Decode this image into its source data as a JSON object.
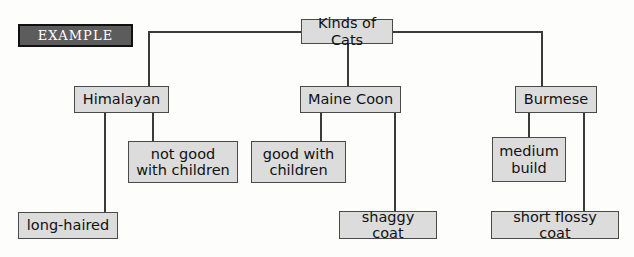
{
  "page": {
    "background": "#fdfdfc",
    "box_fill": "#dcdcdc",
    "box_border": "#4a4a4a",
    "line_color": "#3a3a3a",
    "example_fill": "#5c5c5c",
    "example_text_color": "#ffffff"
  },
  "example_tag": {
    "label": "EXAMPLE"
  },
  "diagram": {
    "type": "concept-map",
    "root": {
      "id": "kinds-of-cats",
      "label": "Kinds of Cats"
    },
    "branches": [
      {
        "id": "himalayan",
        "label": "Himalayan",
        "children": [
          {
            "id": "long-haired",
            "label": "long-haired"
          },
          {
            "id": "not-good-with-children",
            "label": "not good\nwith children"
          }
        ]
      },
      {
        "id": "maine-coon",
        "label": "Maine Coon",
        "children": [
          {
            "id": "good-with-children",
            "label": "good with\nchildren"
          },
          {
            "id": "shaggy-coat",
            "label": "shaggy coat"
          }
        ]
      },
      {
        "id": "burmese",
        "label": "Burmese",
        "children": [
          {
            "id": "medium-build",
            "label": "medium\nbuild"
          },
          {
            "id": "short-flossy-coat",
            "label": "short flossy coat"
          }
        ]
      }
    ]
  }
}
